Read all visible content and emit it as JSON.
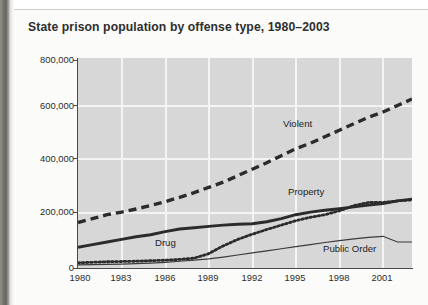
{
  "figure": {
    "title": "State prison population by offense type, 1980–2003"
  },
  "axis": {
    "y_ticks": [
      "800,000",
      "600,000",
      "400,000",
      "200,000",
      "0"
    ],
    "x_ticks": [
      "1980",
      "1983",
      "1986",
      "1989",
      "1992",
      "1995",
      "1998",
      "2001"
    ]
  },
  "series_labels": {
    "violent": "Violent",
    "property": "Property",
    "drug": "Drug",
    "public_order": "Public Order"
  },
  "colors": {
    "plot_background": "#d7d7d7",
    "gridline": "#f4f4f4",
    "axis": "#4a4a4a",
    "line": "#2b2b2b",
    "title_text": "#2e2e2e"
  },
  "chart_data": {
    "type": "line",
    "title": "State prison population by offense type, 1980–2003",
    "xlabel": "",
    "ylabel": "",
    "xlim": [
      1980,
      2003
    ],
    "ylim": [
      0,
      800000
    ],
    "grid": true,
    "legend": "inline-labels",
    "x": [
      1980,
      1981,
      1982,
      1983,
      1984,
      1985,
      1986,
      1987,
      1988,
      1989,
      1990,
      1991,
      1992,
      1993,
      1994,
      1995,
      1996,
      1997,
      1998,
      1999,
      2000,
      2001,
      2002,
      2003
    ],
    "series": [
      {
        "name": "Violent",
        "style": "dashed",
        "values": [
          175000,
          190000,
          205000,
          215000,
          227000,
          240000,
          255000,
          272000,
          290000,
          310000,
          330000,
          355000,
          380000,
          405000,
          432000,
          459000,
          480000,
          505000,
          530000,
          555000,
          580000,
          600000,
          625000,
          650000
        ]
      },
      {
        "name": "Drug",
        "style": "thick-solid",
        "values": [
          80000,
          90000,
          100000,
          110000,
          120000,
          128000,
          140000,
          150000,
          155000,
          160000,
          165000,
          168000,
          170000,
          178000,
          190000,
          205000,
          215000,
          222000,
          228000,
          235000,
          242000,
          248000,
          258000,
          265000
        ]
      },
      {
        "name": "Property",
        "style": "dotted",
        "values": [
          20000,
          22000,
          24000,
          25000,
          26000,
          28000,
          30000,
          33000,
          38000,
          55000,
          85000,
          110000,
          130000,
          148000,
          165000,
          182000,
          195000,
          205000,
          220000,
          240000,
          252000,
          252000,
          258000,
          262000
        ]
      },
      {
        "name": "Public Order",
        "style": "thin-solid",
        "values": [
          12000,
          13000,
          14000,
          15000,
          17000,
          19000,
          22000,
          26000,
          30000,
          35000,
          42000,
          50000,
          58000,
          66000,
          74000,
          82000,
          90000,
          98000,
          105000,
          112000,
          118000,
          122000,
          100000,
          100000
        ]
      }
    ]
  }
}
